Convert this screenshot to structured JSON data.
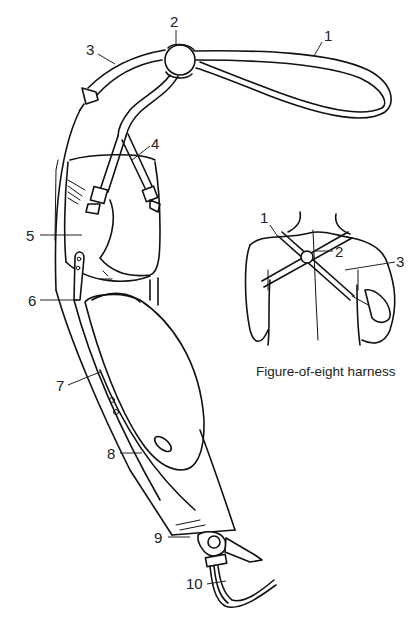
{
  "diagram": {
    "main_labels": [
      {
        "id": "1",
        "text": "1"
      },
      {
        "id": "2",
        "text": "2"
      },
      {
        "id": "3",
        "text": "3"
      },
      {
        "id": "4",
        "text": "4"
      },
      {
        "id": "5",
        "text": "5"
      },
      {
        "id": "6",
        "text": "6"
      },
      {
        "id": "7",
        "text": "7"
      },
      {
        "id": "8",
        "text": "8"
      },
      {
        "id": "9",
        "text": "9"
      },
      {
        "id": "10",
        "text": "10"
      }
    ],
    "inset": {
      "caption": "Figure-of-eight harness",
      "labels": [
        {
          "id": "1",
          "text": "1"
        },
        {
          "id": "2",
          "text": "2"
        },
        {
          "id": "3",
          "text": "3"
        }
      ]
    },
    "colors": {
      "line": "#111111",
      "background": "#ffffff"
    }
  }
}
